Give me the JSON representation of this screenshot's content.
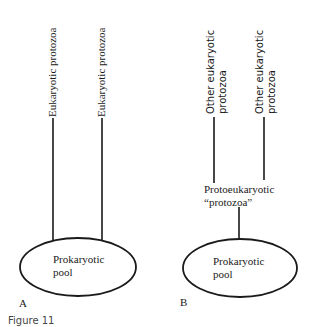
{
  "panel_a": {
    "letter": "A",
    "branch_labels": [
      "Eukaryotic protozoa",
      "Eukaryotic protozoa"
    ],
    "pool_label_line1": "Prokaryotic",
    "pool_label_line2": "pool"
  },
  "panel_b": {
    "letter": "B",
    "branch_labels": [
      {
        "line1": "Other eukaryotic",
        "line2": "protozoa"
      },
      {
        "line1": "Other eukaryotic",
        "line2": "protozoa"
      }
    ],
    "intermediate_label_line1": "Protoeukaryotic",
    "intermediate_label_line2": "“protozoa”",
    "pool_label_line1": "Prokaryotic",
    "pool_label_line2": "pool"
  },
  "caption": "Figure 11"
}
